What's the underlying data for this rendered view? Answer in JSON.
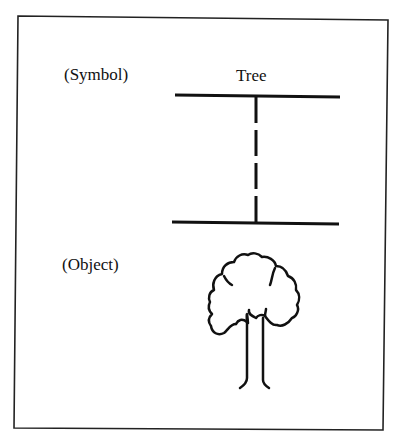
{
  "diagram": {
    "symbol_label": "(Symbol)",
    "object_label": "(Object)",
    "symbol_word": "Tree",
    "object_icon": "tree-icon"
  }
}
